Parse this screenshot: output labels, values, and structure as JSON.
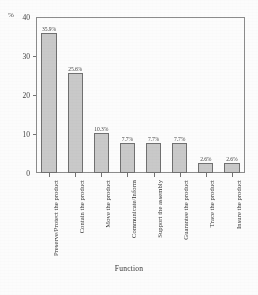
{
  "chart_data": {
    "type": "bar",
    "title": "",
    "subtitle": "",
    "xlabel": "Function",
    "ylabel": "%",
    "ylim": [
      0,
      40
    ],
    "yticks": [
      0,
      10,
      20,
      30,
      40
    ],
    "ytick_labels": [
      "0",
      "10",
      "20",
      "30",
      "40"
    ],
    "grid": false,
    "legend": false,
    "categories": [
      "Preserve/Protect the product",
      "Contain the product",
      "Move the product",
      "Communicate/Inform",
      "Support the assembly",
      "Guarantee the product",
      "Trace the product",
      "Insure the product"
    ],
    "values": [
      35.9,
      25.6,
      10.3,
      7.7,
      7.7,
      7.7,
      2.6,
      2.6
    ],
    "data_labels": [
      "35.9%",
      "25.6%",
      "10.3%",
      "7.7%",
      "7.7%",
      "7.7%",
      "2.6%",
      "2.6%"
    ],
    "bar_fill_color": "#c9c9c9",
    "bar_border_color": "#6d6d6d",
    "axis_color": "#8a8a8a"
  },
  "axes": {
    "y_unit_label": "%",
    "x_axis_title": "Function",
    "y_tick_labels": [
      "40",
      "30",
      "20",
      "10",
      "0"
    ]
  },
  "bars": [
    {
      "label": "Preserve/Protect the product",
      "value": 35.9,
      "data_label": "35.9%"
    },
    {
      "label": "Contain the product",
      "value": 25.6,
      "data_label": "25.6%"
    },
    {
      "label": "Move the product",
      "value": 10.3,
      "data_label": "10.3%"
    },
    {
      "label": "Communicate/Inform",
      "value": 7.7,
      "data_label": "7.7%"
    },
    {
      "label": "Support the assembly",
      "value": 7.7,
      "data_label": "7.7%"
    },
    {
      "label": "Guarantee the product",
      "value": 7.7,
      "data_label": "7.7%"
    },
    {
      "label": "Trace the product",
      "value": 2.6,
      "data_label": "2.6%"
    },
    {
      "label": "Insure the product",
      "value": 2.6,
      "data_label": "2.6%"
    }
  ]
}
